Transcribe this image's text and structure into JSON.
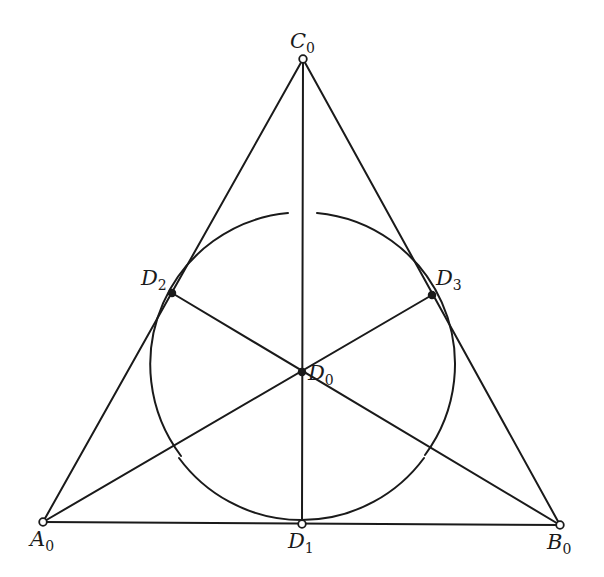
{
  "figure": {
    "points": {
      "C0": {
        "name": "C",
        "sub": "0",
        "x": 303,
        "y": 59
      },
      "A0": {
        "name": "A",
        "sub": "0",
        "x": 43,
        "y": 522
      },
      "B0": {
        "name": "B",
        "sub": "0",
        "x": 560,
        "y": 525
      },
      "D0": {
        "name": "D",
        "sub": "0",
        "x": 302,
        "y": 372
      },
      "D1": {
        "name": "D",
        "sub": "1",
        "x": 302,
        "y": 524
      },
      "D2": {
        "name": "D",
        "sub": "2",
        "x": 172,
        "y": 293
      },
      "D3": {
        "name": "D",
        "sub": "3",
        "x": 432,
        "y": 295
      }
    },
    "segments": [
      [
        "A0",
        "B0"
      ],
      [
        "B0",
        "C0"
      ],
      [
        "C0",
        "A0"
      ],
      [
        "C0",
        "D1"
      ],
      [
        "A0",
        "D3"
      ],
      [
        "B0",
        "D2"
      ]
    ],
    "circle": {
      "center": "D0",
      "radius": 152,
      "gapped": true
    },
    "line_color": "#1a1a1a",
    "background": "#ffffff"
  }
}
